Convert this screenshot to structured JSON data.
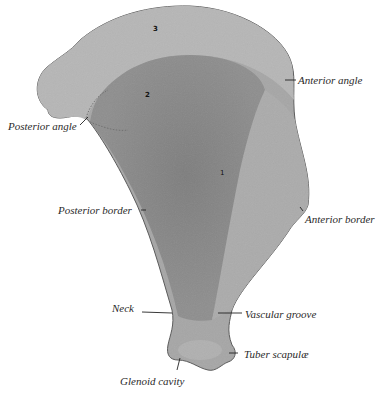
{
  "figure": {
    "colors": {
      "background": "#ffffff",
      "bone_light": "#b4b4b4",
      "bone_mid": "#9a9a9a",
      "bone_dark": "#7e7e7e",
      "outline": "#5a5a5a",
      "label_text": "#2a2a2a"
    },
    "region_numbers": [
      "3",
      "2",
      "1"
    ],
    "labels": {
      "posterior_angle": "Posterior angle",
      "anterior_angle": "Anterior angle",
      "posterior_border": "Posterior border",
      "anterior_border": "Anterior border",
      "neck": "Neck",
      "vascular_groove": "Vascular groove",
      "tuber_scapulae": "Tuber scapulæ",
      "glenoid_cavity": "Glenoid cavity"
    }
  }
}
